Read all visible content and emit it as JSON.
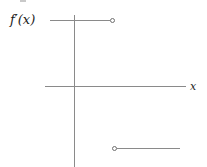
{
  "figure": {
    "title": "",
    "background_color": "#ffffff",
    "line_color": "#8a8a8a",
    "text_color": "#1c1c1c",
    "width": 207,
    "height": 167
  },
  "labels": {
    "function_label": "f′(x)",
    "x_axis_label": "x"
  },
  "chart_data": {
    "type": "line",
    "title": "",
    "xlabel": "x",
    "ylabel": "f'(x)",
    "grid": false,
    "legend": "none",
    "axes": {
      "x_axis": {
        "start_px": [
          45,
          86
        ],
        "end_px": [
          186,
          86
        ],
        "arrow": false
      },
      "y_axis": {
        "start_px": [
          74,
          15
        ],
        "end_px": [
          74,
          167
        ],
        "arrow": false
      },
      "origin_px": [
        74,
        86
      ]
    },
    "series": [
      {
        "name": "left branch",
        "style": "horizontal-segment",
        "value": "positive constant",
        "start_px": [
          50,
          20
        ],
        "end_px": [
          113,
          20
        ],
        "left_endpoint": "open-left-edge",
        "right_endpoint": "open-circle"
      },
      {
        "name": "right branch",
        "style": "horizontal-segment",
        "value": "negative constant",
        "start_px": [
          114,
          148
        ],
        "end_px": [
          180,
          148
        ],
        "left_endpoint": "open-circle",
        "right_endpoint": "open-right-edge"
      }
    ],
    "endpoints": [
      {
        "name": "upper-open-endpoint",
        "px": [
          113,
          21
        ],
        "filled": false
      },
      {
        "name": "lower-open-endpoint",
        "px": [
          114,
          149
        ],
        "filled": false
      }
    ]
  }
}
